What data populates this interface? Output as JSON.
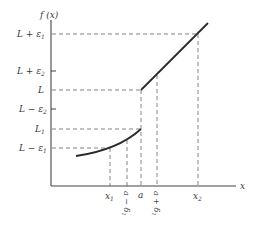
{
  "diagram": {
    "type": "piecewise-function-limit-illustration",
    "y_axis_label": "f (x)",
    "x_axis_label": "x",
    "y_labels": [
      {
        "id": "l_plus_e1",
        "text": "L + ε",
        "sub": "1",
        "y": 34
      },
      {
        "id": "l_plus_e2",
        "text": "L + ε",
        "sub": "2",
        "y": 71
      },
      {
        "id": "l",
        "text": "L",
        "sub": "",
        "y": 90
      },
      {
        "id": "l_minus_e2",
        "text": "L − ε",
        "sub": "2",
        "y": 109
      },
      {
        "id": "l1",
        "text": "L",
        "sub": "1",
        "y": 129
      },
      {
        "id": "l_minus_e1",
        "text": "L − ε",
        "sub": "1",
        "y": 148
      }
    ],
    "x_labels": [
      {
        "id": "x1",
        "text": "x",
        "sub": "1",
        "x": 110
      },
      {
        "id": "a_minus_d1",
        "text": "a − δ",
        "sub": "1",
        "x": 127,
        "rotated": true
      },
      {
        "id": "a",
        "text": "a",
        "sub": "",
        "x": 141
      },
      {
        "id": "a_plus_d1",
        "text": "a + δ",
        "sub": "1",
        "x": 157,
        "rotated": true
      },
      {
        "id": "x2",
        "text": "x",
        "sub": "2",
        "x": 198
      }
    ],
    "curves": [
      {
        "name": "lower-branch",
        "description": "increasing concave-up curve for x < a ending at (a, L1)"
      },
      {
        "name": "upper-branch",
        "description": "straight line for x > a starting at (a, L)"
      }
    ]
  }
}
